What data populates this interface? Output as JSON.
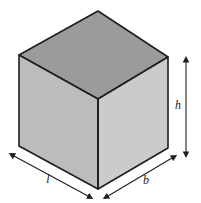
{
  "figure": {
    "name": "cuboid-dimension-diagram",
    "shape": "cuboid",
    "background_color": "#ffffff",
    "faces": {
      "top": {
        "name": "top-face",
        "color": "#9b9b9b"
      },
      "left": {
        "name": "left-front-face",
        "color": "#bcbcbc"
      },
      "right": {
        "name": "right-front-face",
        "color": "#cbcbcb"
      }
    },
    "edge_color": "#1e1e1e",
    "vertices": {
      "top_back": [
        98,
        11
      ],
      "top_left": [
        19,
        55
      ],
      "top_right": [
        168,
        57
      ],
      "top_front": [
        98,
        99
      ],
      "bottom_left": [
        19,
        146
      ],
      "bottom_front": [
        98,
        189
      ],
      "bottom_right": [
        168,
        148
      ]
    },
    "dimensions": [
      {
        "name": "height",
        "label": "h",
        "label_x": 181,
        "label_y": 105,
        "arrow": "double-headed",
        "orientation": "vertical",
        "from": [
          186,
          62
        ],
        "to": [
          186,
          152
        ]
      },
      {
        "name": "length",
        "label": "l",
        "label_x": 48,
        "label_y": 183,
        "arrow": "double-headed",
        "orientation": "diagonal-down-right",
        "from": [
          14,
          156
        ],
        "to": [
          88,
          196
        ]
      },
      {
        "name": "breadth",
        "label": "b",
        "label_x": 143,
        "label_y": 184,
        "arrow": "double-headed",
        "orientation": "diagonal-down-left",
        "from": [
          172,
          158
        ],
        "to": [
          108,
          196
        ]
      }
    ]
  }
}
